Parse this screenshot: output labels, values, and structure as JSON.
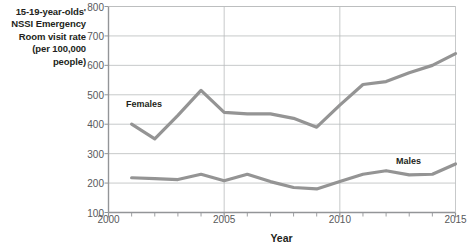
{
  "chart_data": {
    "type": "line",
    "title": "",
    "ylabel": "15-19-year-olds' NSSI Emergency Room visit rate (per 100,000 people)",
    "ylabel_lines": [
      "15-19-year-olds'",
      "NSSI Emergency",
      "Room visit rate",
      "(per 100,000",
      "people)"
    ],
    "xlabel": "Year",
    "xlim": [
      2000,
      2015
    ],
    "ylim": [
      100,
      800
    ],
    "yticks": [
      100,
      200,
      300,
      400,
      500,
      600,
      700,
      800
    ],
    "ytick_labels": [
      "100",
      "200",
      "300",
      "400",
      "500",
      "600",
      "700",
      "800"
    ],
    "xticks": [
      2000,
      2005,
      2010,
      2015
    ],
    "xtick_labels": [
      "2000",
      "2005",
      "2010",
      "2015"
    ],
    "x_minor_ticks": [
      2001,
      2002,
      2003,
      2004,
      2006,
      2007,
      2008,
      2009,
      2011,
      2012,
      2013,
      2014
    ],
    "grid": "horizontal",
    "legend_position": "inline-annotations",
    "x": [
      2001,
      2002,
      2003,
      2004,
      2005,
      2006,
      2007,
      2008,
      2009,
      2010,
      2011,
      2012,
      2013,
      2014,
      2015
    ],
    "series": [
      {
        "name": "Females",
        "color": "#949494",
        "values": [
          400,
          350,
          430,
          515,
          440,
          435,
          435,
          420,
          390,
          465,
          535,
          545,
          575,
          600,
          640
        ]
      },
      {
        "name": "Males",
        "color": "#949494",
        "values": [
          218,
          215,
          212,
          230,
          208,
          230,
          205,
          185,
          180,
          205,
          230,
          242,
          228,
          230,
          265
        ]
      }
    ],
    "annotations": [
      {
        "text": "Females",
        "x": 2002.6,
        "y": 470
      },
      {
        "text": "Males",
        "x": 2012.5,
        "y": 300
      }
    ],
    "colors": {
      "line": "#949494",
      "grid": "#b9bbbd",
      "axis": "#939598",
      "tick_text": "#58595b",
      "title_text": "#231f20",
      "background": "#ffffff"
    }
  }
}
